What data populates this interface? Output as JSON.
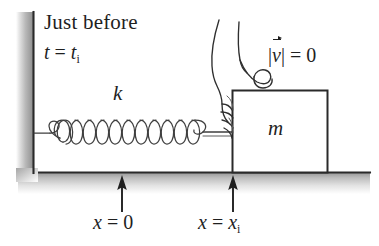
{
  "figure": {
    "name": "spring-block-just-before-release",
    "caption_line1": "Just before",
    "time_label": {
      "var": "t",
      "eq": " = ",
      "val": "t",
      "sub": "i"
    },
    "spring_constant_label": "k",
    "mass_label": "m",
    "velocity_label": {
      "open": "|",
      "var": "v",
      "close": "|",
      "eq": " = ",
      "value": "0"
    },
    "origin_label": {
      "var": "x",
      "eq": " = ",
      "value": "0"
    },
    "initial_position_label": {
      "var": "x",
      "eq": " = ",
      "value": "x",
      "sub": "i"
    },
    "elements": {
      "wall": "wall",
      "ground": "ground",
      "spring": "spring",
      "block": "block",
      "hand": "hand",
      "arrow_origin": "arrow-x-equals-0",
      "arrow_initial": "arrow-x-equals-xi"
    },
    "colors": {
      "ink": "#1f1f1f",
      "hatch": "#8d8d8d",
      "spring_line": "#4a4a4a",
      "background": "#ffffff"
    }
  }
}
